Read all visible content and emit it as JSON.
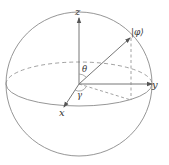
{
  "diagram": {
    "type": "bloch-sphere",
    "labels": {
      "z_axis": "z",
      "y_axis": "y",
      "x_axis": "x",
      "state": "|φ⟩",
      "theta": "θ",
      "gamma": "γ"
    },
    "colors": {
      "line": "#8a8a8a",
      "axis": "#666666",
      "text": "#333333",
      "background": "#ffffff"
    }
  }
}
